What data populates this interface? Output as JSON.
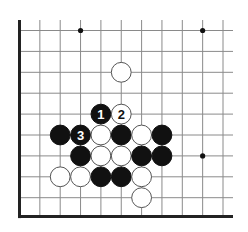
{
  "diagram": {
    "type": "go-board-fragment",
    "visible_columns": 11,
    "visible_rows": 10,
    "edges": {
      "left": true,
      "bottom": true,
      "top": false,
      "right": false
    },
    "colors": {
      "line": "#8a8a8a",
      "edge": "#222222",
      "black": "#111111",
      "white": "#ffffff",
      "stone_outline": "#555555",
      "star": "#111111"
    },
    "star_points": [
      {
        "col": 3,
        "row": 0
      },
      {
        "col": 9,
        "row": 0
      },
      {
        "col": 9,
        "row": 6
      }
    ],
    "stones": [
      {
        "color": "white",
        "col": 5,
        "row": 2,
        "label": ""
      },
      {
        "color": "black",
        "col": 4,
        "row": 4,
        "label": "1"
      },
      {
        "color": "white",
        "col": 5,
        "row": 4,
        "label": "2"
      },
      {
        "color": "black",
        "col": 2,
        "row": 5,
        "label": ""
      },
      {
        "color": "black",
        "col": 3,
        "row": 5,
        "label": "3"
      },
      {
        "color": "white",
        "col": 4,
        "row": 5,
        "label": ""
      },
      {
        "color": "black",
        "col": 5,
        "row": 5,
        "label": ""
      },
      {
        "color": "white",
        "col": 6,
        "row": 5,
        "label": ""
      },
      {
        "color": "black",
        "col": 7,
        "row": 5,
        "label": ""
      },
      {
        "color": "black",
        "col": 3,
        "row": 6,
        "label": ""
      },
      {
        "color": "white",
        "col": 4,
        "row": 6,
        "label": ""
      },
      {
        "color": "white",
        "col": 5,
        "row": 6,
        "label": ""
      },
      {
        "color": "black",
        "col": 6,
        "row": 6,
        "label": ""
      },
      {
        "color": "black",
        "col": 7,
        "row": 6,
        "label": ""
      },
      {
        "color": "white",
        "col": 2,
        "row": 7,
        "label": ""
      },
      {
        "color": "white",
        "col": 3,
        "row": 7,
        "label": ""
      },
      {
        "color": "black",
        "col": 4,
        "row": 7,
        "label": ""
      },
      {
        "color": "black",
        "col": 5,
        "row": 7,
        "label": ""
      },
      {
        "color": "white",
        "col": 6,
        "row": 7,
        "label": ""
      },
      {
        "color": "white",
        "col": 6,
        "row": 8,
        "label": ""
      }
    ],
    "move_labels": [
      "1",
      "2",
      "3"
    ]
  }
}
